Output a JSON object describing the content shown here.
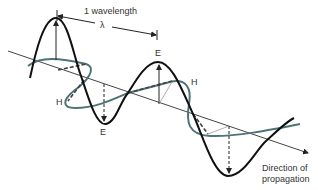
{
  "diagram": {
    "wavelength_label": "1 wavelength",
    "lambda_symbol": "λ",
    "field_labels": {
      "e_top_right": "E",
      "e_bottom_left": "E",
      "h_left": "H",
      "h_right": "H"
    },
    "direction_label_line1": "Direction of",
    "direction_label_line2": "propagation",
    "colors": {
      "electric": "#1a1a1a",
      "magnetic": "#4e7478",
      "axis": "#444444"
    }
  }
}
